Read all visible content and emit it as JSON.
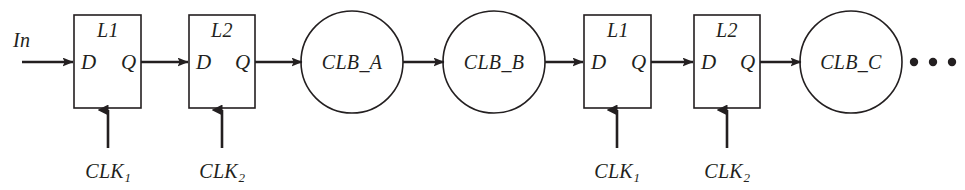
{
  "figure": {
    "stroke_color": "#231f20",
    "background_color": "#ffffff",
    "input_label": "In",
    "ellipsis": "• • •"
  },
  "latches": [
    {
      "id": "latch-l1-a",
      "name": "L1",
      "d_port": "D",
      "q_port": "Q",
      "clock": "CLK",
      "clock_index": "1",
      "x": 74,
      "y": 15,
      "w": 67,
      "h": 93
    },
    {
      "id": "latch-l2-a",
      "name": "L2",
      "d_port": "D",
      "q_port": "Q",
      "clock": "CLK",
      "clock_index": "2",
      "x": 189,
      "y": 15,
      "w": 66,
      "h": 93
    },
    {
      "id": "latch-l1-b",
      "name": "L1",
      "d_port": "D",
      "q_port": "Q",
      "clock": "CLK",
      "clock_index": "1",
      "x": 584,
      "y": 15,
      "w": 67,
      "h": 93
    },
    {
      "id": "latch-l2-b",
      "name": "L2",
      "d_port": "D",
      "q_port": "Q",
      "clock": "CLK",
      "clock_index": "2",
      "x": 694,
      "y": 15,
      "w": 66,
      "h": 93
    }
  ],
  "blocks": [
    {
      "id": "clb-a",
      "label": "CLB_A",
      "cx": 352,
      "cy": 62,
      "r": 51
    },
    {
      "id": "clb-b",
      "label": "CLB_B",
      "cx": 494,
      "cy": 62,
      "r": 51
    },
    {
      "id": "clb-c",
      "label": "CLB_C",
      "cx": 851,
      "cy": 62,
      "r": 51
    }
  ],
  "clock_labels": [
    {
      "id": "clk-1-a",
      "text": "CLK",
      "index": "1",
      "cx": 108,
      "y": 160
    },
    {
      "id": "clk-2-a",
      "text": "CLK",
      "index": "2",
      "cx": 222,
      "y": 160
    },
    {
      "id": "clk-1-b",
      "text": "CLK",
      "index": "1",
      "cx": 617,
      "y": 160
    },
    {
      "id": "clk-2-b",
      "text": "CLK",
      "index": "2",
      "cx": 727,
      "y": 160
    }
  ],
  "ellipsis_dots": [
    {
      "cx": 914,
      "cy": 62,
      "r": 4.2
    },
    {
      "cx": 933,
      "cy": 62,
      "r": 4.2
    },
    {
      "cx": 952,
      "cy": 62,
      "r": 4.2
    }
  ]
}
